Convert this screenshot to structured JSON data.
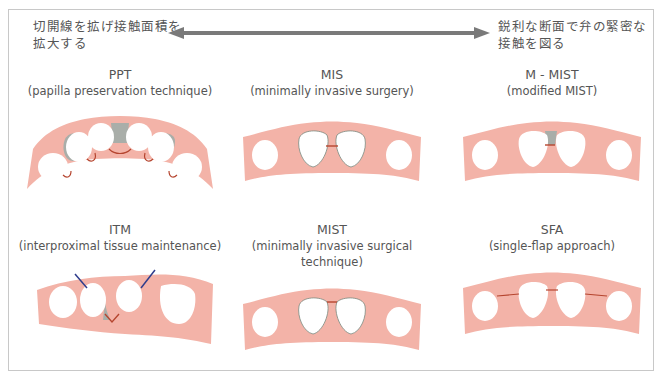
{
  "header": {
    "left_line1": "切開線を拡げ接触面積を",
    "left_line2": "拡大する",
    "right_line1": "鋭利な断面で弁の緊密な",
    "right_line2": "接触を図る",
    "arrow": "double-headed-arrow"
  },
  "colors": {
    "gingiva": "#f3b3a8",
    "gingiva_edge": "#f7c9c0",
    "tooth": "#ffffff",
    "papilla_gray": "#a9aea9",
    "incision_red": "#b5452f",
    "incision_blue": "#2f3d8c",
    "arrow": "#7a7a7a",
    "border": "#c8c8c8"
  },
  "panels": [
    {
      "title": "PPT",
      "subtitle": "(papilla preservation technique)"
    },
    {
      "title": "MIS",
      "subtitle": "(minimally invasive surgery)"
    },
    {
      "title": "M - MIST",
      "subtitle": "(modified MIST)"
    },
    {
      "title": "ITM",
      "subtitle": "(interproximal tissue maintenance)"
    },
    {
      "title": "MIST",
      "subtitle": "(minimally invasive surgical technique)"
    },
    {
      "title": "SFA",
      "subtitle": "(single-flap approach)"
    }
  ]
}
